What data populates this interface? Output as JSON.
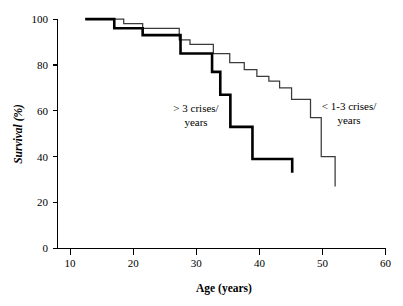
{
  "chart_data": {
    "type": "line",
    "subtype": "kaplan-meier-step",
    "title": "",
    "xlabel": "Age (years)",
    "ylabel": "Survival (%)",
    "xlim": [
      10,
      60
    ],
    "ylim": [
      0,
      100
    ],
    "xticks": [
      10,
      20,
      30,
      40,
      50,
      60
    ],
    "yticks": [
      0,
      20,
      40,
      60,
      80,
      100
    ],
    "xtick_labels": [
      "10",
      "20",
      "30",
      "40",
      "50",
      "60"
    ],
    "ytick_labels": [
      "0",
      "20",
      "40",
      "60",
      "80",
      "100"
    ],
    "grid": false,
    "legend_position": "inline-annotations",
    "series": [
      {
        "name": "> 3 crises/ years",
        "label_line1": "> 3 crises/",
        "label_line2": "years",
        "style": "thick",
        "color": "#000000",
        "x": [
          12.4,
          17.0,
          17.0,
          21.5,
          21.5,
          27.5,
          27.5,
          32.5,
          32.5,
          33.8,
          33.8,
          35.4,
          35.4,
          38.9,
          38.9,
          45.2,
          45.2
        ],
        "y": [
          100,
          100,
          96,
          96,
          93,
          93,
          85,
          85,
          77,
          77,
          67,
          67,
          53,
          53,
          39,
          39,
          33
        ],
        "steps": [
          {
            "age": 12.4,
            "survival": 100
          },
          {
            "age": 17.0,
            "survival": 96
          },
          {
            "age": 21.5,
            "survival": 93
          },
          {
            "age": 27.5,
            "survival": 85
          },
          {
            "age": 32.5,
            "survival": 77
          },
          {
            "age": 33.8,
            "survival": 67
          },
          {
            "age": 35.4,
            "survival": 53
          },
          {
            "age": 38.9,
            "survival": 39
          },
          {
            "age": 45.2,
            "survival": 33
          }
        ]
      },
      {
        "name": "< 1-3 crises/ years",
        "label_line1": "< 1-3 crises/",
        "label_line2": "years",
        "style": "thin",
        "color": "#3a3a3a",
        "x": [
          12.4,
          18.5,
          18.5,
          21.5,
          21.5,
          27.3,
          27.3,
          29.0,
          29.0,
          32.7,
          32.7,
          35.3,
          35.3,
          37.6,
          37.6,
          39.6,
          39.6,
          41.5,
          41.5,
          43.2,
          43.2,
          45.1,
          45.1,
          48.1,
          48.1,
          49.8,
          49.8,
          52.0,
          52.0
        ],
        "y": [
          100,
          100,
          98,
          98,
          96,
          96,
          91,
          91,
          89,
          89,
          85,
          85,
          81,
          81,
          78,
          78,
          75,
          75,
          73,
          73,
          70,
          70,
          65,
          65,
          57,
          57,
          40,
          40,
          27
        ],
        "steps": [
          {
            "age": 12.4,
            "survival": 100
          },
          {
            "age": 18.5,
            "survival": 98
          },
          {
            "age": 21.5,
            "survival": 96
          },
          {
            "age": 27.3,
            "survival": 91
          },
          {
            "age": 29.0,
            "survival": 89
          },
          {
            "age": 32.7,
            "survival": 85
          },
          {
            "age": 35.3,
            "survival": 81
          },
          {
            "age": 37.6,
            "survival": 78
          },
          {
            "age": 39.6,
            "survival": 75
          },
          {
            "age": 41.5,
            "survival": 73
          },
          {
            "age": 43.2,
            "survival": 70
          },
          {
            "age": 45.1,
            "survival": 65
          },
          {
            "age": 48.1,
            "survival": 57
          },
          {
            "age": 49.8,
            "survival": 40
          },
          {
            "age": 52.0,
            "survival": 27
          }
        ]
      }
    ],
    "annotations": [
      {
        "text_line1": "> 3 crises/",
        "text_line2": "years",
        "x": 27.5,
        "y": 58
      },
      {
        "text_line1": "< 1-3 crises/",
        "text_line2": "years",
        "x": 49.0,
        "y": 60
      }
    ]
  }
}
